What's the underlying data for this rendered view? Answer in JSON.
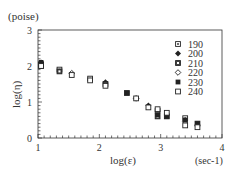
{
  "chart_data": {
    "type": "scatter",
    "title": "",
    "xlabel": "log(ε)",
    "ylabel": "log(η)",
    "x_unit": "(sec-1)",
    "y_unit": "(poise)",
    "xlim": [
      1,
      4
    ],
    "ylim": [
      0,
      3
    ],
    "xticks": [
      "1",
      "2",
      "3",
      "4"
    ],
    "yticks": [
      "0",
      "1",
      "2",
      "3"
    ],
    "grid": false,
    "legend_position": "top-right",
    "series": [
      {
        "name": "190",
        "marker": "square-dot-open",
        "points": [
          [
            1.05,
            2.05
          ],
          [
            1.35,
            1.9
          ],
          [
            1.85,
            1.65
          ],
          [
            2.45,
            1.25
          ],
          [
            2.95,
            0.75
          ],
          [
            3.4,
            0.55
          ]
        ]
      },
      {
        "name": "200",
        "marker": "diamond-filled",
        "points": [
          [
            1.05,
            2.1
          ],
          [
            2.1,
            1.55
          ],
          [
            2.8,
            0.9
          ],
          [
            3.6,
            0.35
          ]
        ]
      },
      {
        "name": "210",
        "marker": "square-dot-filled",
        "points": [
          [
            1.05,
            2.0
          ],
          [
            1.35,
            1.85
          ],
          [
            2.1,
            1.5
          ],
          [
            2.95,
            0.6
          ],
          [
            3.1,
            0.6
          ],
          [
            3.6,
            0.4
          ]
        ]
      },
      {
        "name": "220",
        "marker": "diamond-open",
        "points": [
          [
            1.55,
            1.8
          ],
          [
            2.6,
            1.1
          ],
          [
            3.4,
            0.45
          ]
        ]
      },
      {
        "name": "230",
        "marker": "square-filled",
        "points": [
          [
            1.05,
            2.1
          ],
          [
            2.45,
            1.25
          ],
          [
            2.95,
            0.65
          ],
          [
            3.1,
            0.6
          ],
          [
            3.4,
            0.5
          ],
          [
            3.6,
            0.4
          ]
        ]
      },
      {
        "name": "240",
        "marker": "square-open",
        "points": [
          [
            1.05,
            2.0
          ],
          [
            1.55,
            1.75
          ],
          [
            1.85,
            1.6
          ],
          [
            2.1,
            1.45
          ],
          [
            2.6,
            1.1
          ],
          [
            2.8,
            0.85
          ],
          [
            2.95,
            0.8
          ],
          [
            3.1,
            0.7
          ],
          [
            3.4,
            0.35
          ],
          [
            3.6,
            0.3
          ]
        ]
      }
    ]
  }
}
